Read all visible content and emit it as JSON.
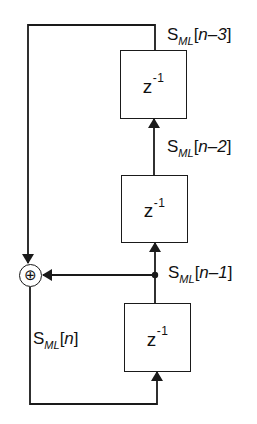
{
  "diagram": {
    "type": "signal-flow block diagram",
    "delay_blocks": [
      {
        "id": "delay-top",
        "label_base": "z",
        "label_exp": "-1"
      },
      {
        "id": "delay-middle",
        "label_base": "z",
        "label_exp": "-1"
      },
      {
        "id": "delay-bottom",
        "label_base": "z",
        "label_exp": "-1"
      }
    ],
    "summing_junction": {
      "symbol": "⊕"
    },
    "signals": {
      "n3": {
        "base": "S",
        "sub": "ML",
        "open": "[",
        "index": "n–3",
        "close": "]"
      },
      "n2": {
        "base": "S",
        "sub": "ML",
        "open": "[",
        "index": "n–2",
        "close": "]"
      },
      "n1": {
        "base": "S",
        "sub": "ML",
        "open": "[",
        "index": "n–1",
        "close": "]"
      },
      "n0": {
        "base": "S",
        "sub": "ML",
        "open": "[",
        "index": "n",
        "close": "]"
      }
    },
    "colors": {
      "line": "#1a1a1a",
      "background": "#ffffff"
    }
  }
}
